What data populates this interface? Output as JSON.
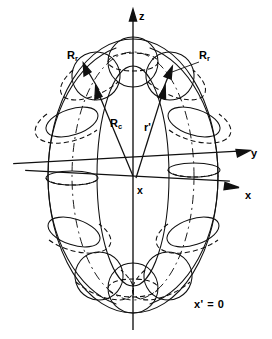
{
  "figure": {
    "kind": "torus-coordinate-diagram",
    "background_color": "#ffffff",
    "line_color": "#000000"
  },
  "axes": {
    "z": {
      "label": "z",
      "direction": "up",
      "arrow": true
    },
    "y": {
      "label": "y",
      "direction": "right-upper",
      "arrow": true
    },
    "x": {
      "label": "x",
      "direction": "right-lower",
      "arrow": true
    },
    "origin_label": "x"
  },
  "annotations": {
    "minor_radius_left": "R",
    "minor_radius_left_sub": "r",
    "minor_radius_right": "R",
    "minor_radius_right_sub": "r",
    "major_radius": "R",
    "major_radius_sub": "c",
    "position_vector": "r'",
    "plane_label": "x' = 0"
  },
  "geometry": {
    "origin_px": [
      133,
      176
    ],
    "torus_major_radius_px": 83,
    "torus_minor_radius_px": 26,
    "cross_section_count": 12,
    "outer_outline_top_px": 38,
    "outer_outline_bottom_px": 312
  }
}
